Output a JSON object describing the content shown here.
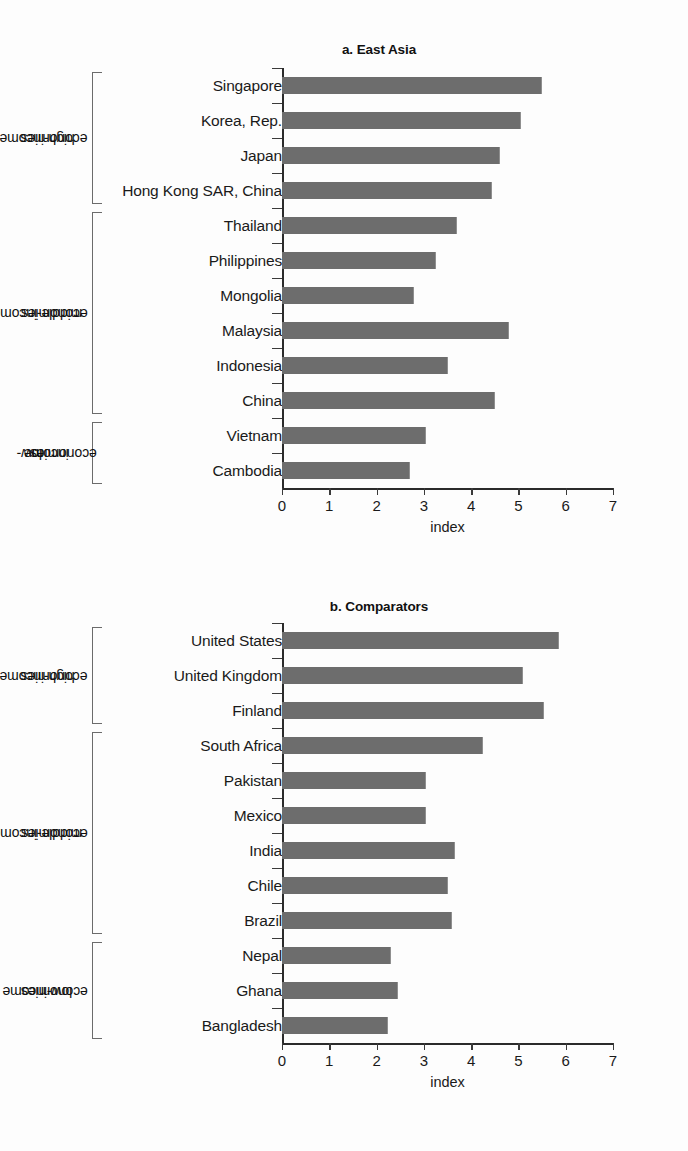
{
  "chart_data": [
    {
      "type": "bar",
      "orientation": "horizontal",
      "title": "a. East Asia",
      "xlabel": "index",
      "ylabel": "",
      "xlim": [
        0,
        7
      ],
      "xticks": [
        "0",
        "1",
        "2",
        "3",
        "4",
        "5",
        "6",
        "7"
      ],
      "grid": false,
      "legend": "none",
      "bar_color": "#6d6d6d",
      "categories": [
        "Singapore",
        "Korea, Rep.",
        "Japan",
        "Hong Kong SAR, China",
        "Thailand",
        "Philippines",
        "Mongolia",
        "Malaysia",
        "Indonesia",
        "China",
        "Vietnam",
        "Cambodia"
      ],
      "values": [
        5.5,
        5.05,
        4.6,
        4.45,
        3.7,
        3.25,
        2.8,
        4.8,
        3.5,
        4.5,
        3.05,
        2.7
      ],
      "groups": [
        {
          "label": "high-income economies",
          "label_lines": [
            "high-income",
            "economies"
          ],
          "start": 0,
          "end": 3
        },
        {
          "label": "middle-income economies",
          "label_lines": [
            "middle-income",
            "economies"
          ],
          "start": 4,
          "end": 9
        },
        {
          "label": "low-income economies",
          "label_lines": [
            "low-",
            "income",
            "economies"
          ],
          "start": 10,
          "end": 11
        }
      ]
    },
    {
      "type": "bar",
      "orientation": "horizontal",
      "title": "b. Comparators",
      "xlabel": "index",
      "ylabel": "",
      "xlim": [
        0,
        7
      ],
      "xticks": [
        "0",
        "1",
        "2",
        "3",
        "4",
        "5",
        "6",
        "7"
      ],
      "grid": false,
      "legend": "none",
      "bar_color": "#6d6d6d",
      "categories": [
        "United States",
        "United Kingdom",
        "Finland",
        "South Africa",
        "Pakistan",
        "Mexico",
        "India",
        "Chile",
        "Brazil",
        "Nepal",
        "Ghana",
        "Bangladesh"
      ],
      "values": [
        5.85,
        5.1,
        5.55,
        4.25,
        3.05,
        3.05,
        3.65,
        3.5,
        3.6,
        2.3,
        2.45,
        2.25
      ],
      "groups": [
        {
          "label": "high-income economies",
          "label_lines": [
            "high-income",
            "economies"
          ],
          "start": 0,
          "end": 2
        },
        {
          "label": "middle-income economies",
          "label_lines": [
            "middle-income",
            "economies"
          ],
          "start": 3,
          "end": 8
        },
        {
          "label": "low-income economies",
          "label_lines": [
            "low-income",
            "economies"
          ],
          "start": 9,
          "end": 11
        }
      ]
    }
  ]
}
